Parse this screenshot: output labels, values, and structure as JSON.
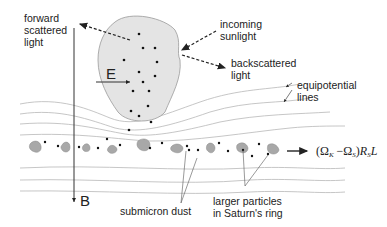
{
  "diagram": {
    "labels": {
      "forward_scattered": "forward\nscattered\nlight",
      "incoming_sunlight": "incoming\nsunlight",
      "backscattered": "backscattered\nlight",
      "equipotential": "equipotential\nlines",
      "submicron_dust": "submicron dust",
      "larger_particles": "larger particles\nin Saturn's ring",
      "E_field": "E",
      "B_field": "B"
    },
    "formula": {
      "open": "(Ω",
      "sub_k": "K",
      "minus": " −Ω",
      "sub_s": "S",
      "close": ")",
      "R": "R",
      "sub_rs": "S",
      "L": "L"
    },
    "colors": {
      "cloud_fill": "#e4e4e4",
      "cloud_stroke": "#9a9a9a",
      "particle_fill": "#a8a8a8",
      "line_gray": "#b0b0b0",
      "ink": "#222222"
    }
  }
}
